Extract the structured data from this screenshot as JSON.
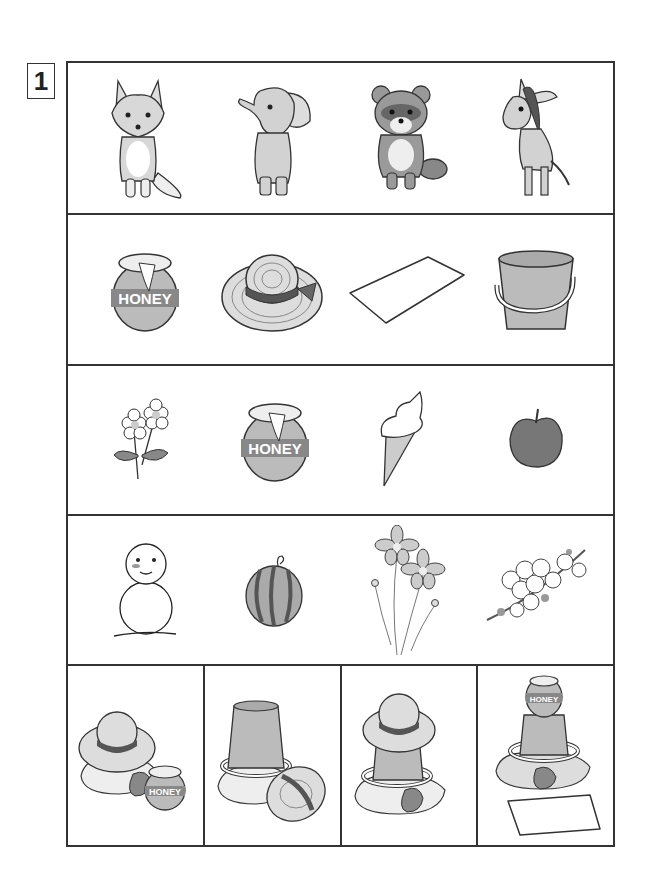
{
  "worksheet": {
    "question_number": "1",
    "rows": [
      {
        "id": "animals",
        "items": [
          {
            "label": "fox"
          },
          {
            "label": "elephant"
          },
          {
            "label": "raccoon dog"
          },
          {
            "label": "donkey"
          }
        ]
      },
      {
        "id": "objects",
        "items": [
          {
            "label": "honey jar"
          },
          {
            "label": "straw hat"
          },
          {
            "label": "towel"
          },
          {
            "label": "bucket"
          }
        ]
      },
      {
        "id": "foods-and-flowers",
        "items": [
          {
            "label": "flowers"
          },
          {
            "label": "honey jar"
          },
          {
            "label": "ice cream cone"
          },
          {
            "label": "apple"
          }
        ]
      },
      {
        "id": "seasons",
        "items": [
          {
            "label": "snowman"
          },
          {
            "label": "watermelon"
          },
          {
            "label": "cosmos flowers"
          },
          {
            "label": "cherry blossoms"
          }
        ]
      }
    ],
    "scenes": [
      {
        "label": "hat on rocks with honey jar"
      },
      {
        "label": "bucket on rocks with hat"
      },
      {
        "label": "hat on bucket on rocks"
      },
      {
        "label": "honey on bucket on rocks with towel"
      }
    ],
    "honey_text": "HONEY"
  },
  "colors": {
    "line": "#333333",
    "gray_light": "#d6d6d6",
    "gray_mid": "#a8a8a8",
    "gray_dark": "#6e6e6e"
  }
}
